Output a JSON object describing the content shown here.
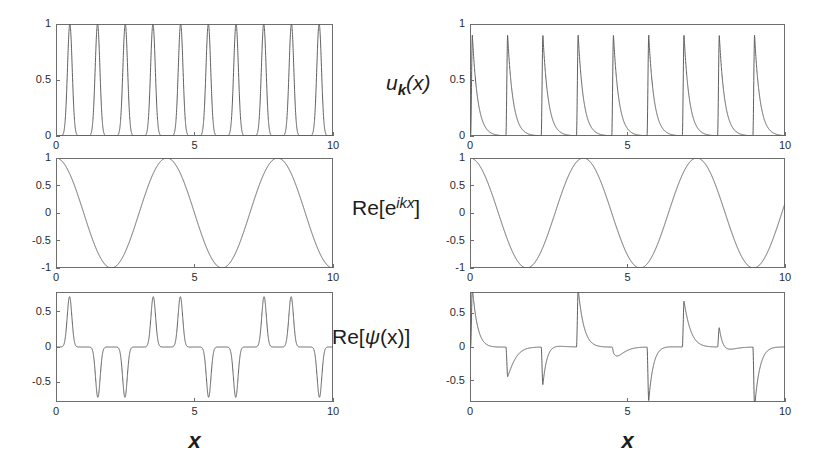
{
  "figure": {
    "background_color": "#ffffff",
    "line_color": "#5f5f5f",
    "axis_color": "#6e6e6e",
    "text_color": "#1d1d1d",
    "rows": 3,
    "columns": 2
  },
  "row_labels": [
    {
      "name": "u-k-of-x",
      "base": "u",
      "sub": "k",
      "tail": "(x)"
    },
    {
      "name": "re-exp-ikx",
      "prefix": "Re[e",
      "sup": "ikx",
      "suffix": "]"
    },
    {
      "name": "re-psi-of-x",
      "prefix": "Re[",
      "psi": "ψ",
      "suffix": "(x)]"
    }
  ],
  "xaxis": {
    "label": "x",
    "ticks": [
      0,
      5,
      10
    ],
    "tick_labels": [
      "0",
      "5",
      "10"
    ],
    "range": [
      0,
      10
    ]
  },
  "chart_data": [
    {
      "name": "u-k-left",
      "type": "line",
      "row": 0,
      "col": 0,
      "title": "",
      "xlabel": "",
      "ylabel": "u_k(x)",
      "xlim": [
        0,
        10
      ],
      "ylim": [
        0,
        1
      ],
      "ytick_labels": [
        "0",
        "0.5",
        "1"
      ],
      "ytick_values": [
        0,
        0.5,
        1
      ],
      "xtick_labels": [
        "0",
        "5",
        "10"
      ],
      "xtick_values": [
        0,
        5,
        10
      ],
      "grid": false,
      "generator": "gaussian_train",
      "params": {
        "period": 1.0,
        "center": 0.5,
        "width": 0.085,
        "amplitude": 1.0,
        "baseline": 0.0
      }
    },
    {
      "name": "u-k-right",
      "type": "line",
      "row": 0,
      "col": 1,
      "title": "",
      "xlabel": "",
      "ylabel": "u_k(x)",
      "xlim": [
        0,
        10
      ],
      "ylim": [
        0,
        1
      ],
      "ytick_labels": [
        "0",
        "0.5",
        "1"
      ],
      "ytick_values": [
        0,
        0.5,
        1
      ],
      "xtick_labels": [
        "0",
        "5",
        "10"
      ],
      "xtick_values": [
        0,
        5,
        10
      ],
      "grid": false,
      "generator": "sawtooth_decay",
      "params": {
        "period": 1.12,
        "offset": 0.02,
        "rise": 0.055,
        "decay": 0.17,
        "amplitude": 0.9,
        "baseline": 0.0
      }
    },
    {
      "name": "plane-wave-left",
      "type": "line",
      "row": 1,
      "col": 0,
      "title": "",
      "xlabel": "",
      "ylabel": "Re[e^{ikx}]",
      "xlim": [
        0,
        10
      ],
      "ylim": [
        -1,
        1
      ],
      "ytick_labels": [
        "-1",
        "-0.5",
        "0",
        "0.5",
        "1"
      ],
      "ytick_values": [
        -1,
        -0.5,
        0,
        0.5,
        1
      ],
      "xtick_labels": [
        "0",
        "5",
        "10"
      ],
      "xtick_values": [
        0,
        5,
        10
      ],
      "grid": false,
      "generator": "cosine",
      "params": {
        "period": 4.0,
        "phase": 0.0,
        "amplitude": 1.0
      }
    },
    {
      "name": "plane-wave-right",
      "type": "line",
      "row": 1,
      "col": 1,
      "title": "",
      "xlabel": "",
      "ylabel": "Re[e^{ikx}]",
      "xlim": [
        0,
        10
      ],
      "ylim": [
        -1,
        1
      ],
      "ytick_labels": [
        "-1",
        "-0.5",
        "0",
        "0.5",
        "1"
      ],
      "ytick_values": [
        -1,
        -0.5,
        0,
        0.5,
        1
      ],
      "xtick_labels": [
        "0",
        "5",
        "10"
      ],
      "xtick_values": [
        0,
        5,
        10
      ],
      "grid": false,
      "generator": "cosine",
      "params": {
        "period": 3.6,
        "phase": 0.0,
        "amplitude": 1.0
      }
    },
    {
      "name": "bloch-psi-left",
      "type": "line",
      "row": 2,
      "col": 0,
      "title": "",
      "xlabel": "x",
      "ylabel": "Re[psi(x)]",
      "xlim": [
        0,
        10
      ],
      "ylim": [
        -0.78,
        0.78
      ],
      "ytick_labels": [
        "-0.5",
        "0",
        "0.5"
      ],
      "ytick_values": [
        -0.5,
        0,
        0.5
      ],
      "xtick_labels": [
        "0",
        "5",
        "10"
      ],
      "xtick_values": [
        0,
        5,
        10
      ],
      "grid": false,
      "generator": "product",
      "params": {
        "envelope": "gaussian_train",
        "carrier": "cosine",
        "period": 1.0,
        "center": 0.5,
        "width": 0.085,
        "amplitude": 1.0,
        "carrier_period": 4.0,
        "carrier_phase": 0.0,
        "clip": 0.72
      }
    },
    {
      "name": "bloch-psi-right",
      "type": "line",
      "row": 2,
      "col": 1,
      "title": "",
      "xlabel": "x",
      "ylabel": "Re[psi(x)]",
      "xlim": [
        0,
        10
      ],
      "ylim": [
        -0.82,
        0.82
      ],
      "ytick_labels": [
        "-0.5",
        "0",
        "0.5"
      ],
      "ytick_values": [
        -0.5,
        0,
        0.5
      ],
      "xtick_labels": [
        "0",
        "5",
        "10"
      ],
      "xtick_values": [
        0,
        5,
        10
      ],
      "grid": false,
      "generator": "product",
      "params": {
        "envelope": "sawtooth_decay",
        "carrier": "cosine",
        "period": 1.12,
        "offset": 0.02,
        "rise": 0.055,
        "decay": 0.17,
        "amplitude": 0.9,
        "carrier_period": 3.6,
        "carrier_phase": 0.0,
        "clip": 0.78
      }
    }
  ],
  "layout": {
    "columns": [
      {
        "name": "left-column",
        "plot_x": 56,
        "plot_width": 277
      },
      {
        "name": "right-column",
        "plot_x": 470,
        "plot_width": 315
      }
    ],
    "rows": [
      {
        "name": "row-uk",
        "plot_y": 24,
        "plot_height": 112
      },
      {
        "name": "row-plane-wave",
        "plot_y": 158,
        "plot_height": 110
      },
      {
        "name": "row-bloch",
        "plot_y": 292,
        "plot_height": 110
      }
    ]
  }
}
